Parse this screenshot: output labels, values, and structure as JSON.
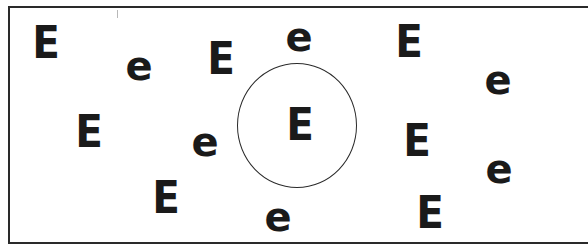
{
  "figure": {
    "colors": {
      "ink": "#1a1a1a",
      "frame": "#2a2a2a",
      "background": "#ffffff"
    },
    "circle": {
      "center_x": 297,
      "center_y": 125,
      "radius_x": 60,
      "radius_y": 62,
      "encloses": "E"
    },
    "letters": [
      {
        "id": "E-top-left",
        "char": "E",
        "x": 46,
        "y": 43,
        "case": "upper"
      },
      {
        "id": "e-top-left",
        "char": "e",
        "x": 139,
        "y": 69,
        "case": "lower"
      },
      {
        "id": "E-top-mid",
        "char": "E",
        "x": 221,
        "y": 59,
        "case": "upper"
      },
      {
        "id": "e-top-center",
        "char": "e",
        "x": 299,
        "y": 40,
        "case": "lower"
      },
      {
        "id": "E-top-right",
        "char": "E",
        "x": 409,
        "y": 42,
        "case": "upper"
      },
      {
        "id": "e-top-right",
        "char": "e",
        "x": 498,
        "y": 83,
        "case": "lower"
      },
      {
        "id": "E-mid-left",
        "char": "E",
        "x": 89,
        "y": 132,
        "case": "upper"
      },
      {
        "id": "e-mid-left",
        "char": "e",
        "x": 205,
        "y": 145,
        "case": "lower"
      },
      {
        "id": "E-circled",
        "char": "E",
        "x": 300,
        "y": 125,
        "case": "upper"
      },
      {
        "id": "E-mid-right",
        "char": "E",
        "x": 417,
        "y": 141,
        "case": "upper"
      },
      {
        "id": "e-mid-right",
        "char": "e",
        "x": 499,
        "y": 172,
        "case": "lower"
      },
      {
        "id": "E-bottom-left",
        "char": "E",
        "x": 166,
        "y": 198,
        "case": "upper"
      },
      {
        "id": "e-bottom-center",
        "char": "e",
        "x": 278,
        "y": 220,
        "case": "lower"
      },
      {
        "id": "E-bottom-right",
        "char": "E",
        "x": 430,
        "y": 213,
        "case": "upper"
      }
    ]
  }
}
